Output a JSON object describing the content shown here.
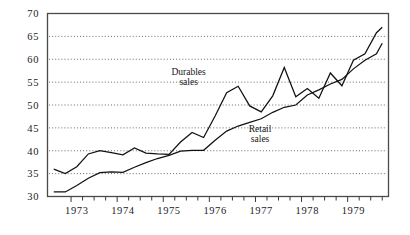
{
  "chart_data": {
    "type": "line",
    "title": "",
    "subtitle": "",
    "xlabel": "",
    "ylabel": "",
    "xlim": [
      1972.5,
      1979.875
    ],
    "ylim": [
      30,
      70
    ],
    "yticks": [
      30,
      35,
      40,
      45,
      50,
      55,
      60,
      65,
      70
    ],
    "ytick_labels": [
      "30",
      "35",
      "40",
      "45",
      "50",
      "55",
      "60",
      "65",
      "70"
    ],
    "xticks": [
      1973,
      1974,
      1975,
      1976,
      1977,
      1978,
      1979
    ],
    "xtick_labels": [
      "1973",
      "1974",
      "1975",
      "1976",
      "1977",
      "1978",
      "1979"
    ],
    "minor_xticks_per_year": 4,
    "grid": "horizontal-dotted",
    "legend": "inline-annotations",
    "x": [
      1972.625,
      1972.875,
      1973.125,
      1973.375,
      1973.625,
      1973.875,
      1974.125,
      1974.375,
      1974.625,
      1974.875,
      1975.125,
      1975.375,
      1975.625,
      1975.875,
      1976.125,
      1976.375,
      1976.625,
      1976.875,
      1977.125,
      1977.375,
      1977.625,
      1977.875,
      1978.125,
      1978.375,
      1978.625,
      1978.875,
      1979.125,
      1979.375,
      1979.625,
      1979.75
    ],
    "series": [
      {
        "name": "Durables sales",
        "label": "Durables\nsales",
        "label_line1": "Durables",
        "label_line2": "sales",
        "color": "#111111",
        "style": "solid",
        "values": [
          36.0,
          35.0,
          36.5,
          39.3,
          40.0,
          39.6,
          39.1,
          40.6,
          39.5,
          39.3,
          39.2,
          41.9,
          44.0,
          42.9,
          47.6,
          52.7,
          54.1,
          49.8,
          48.5,
          52.0,
          58.2,
          51.8,
          53.6,
          51.5,
          57.0,
          54.2,
          59.8,
          61.2,
          65.8,
          67.0
        ]
      },
      {
        "name": "Retail sales",
        "label": "Retail\nsales",
        "label_line1": "Retail",
        "label_line2": "sales",
        "color": "#111111",
        "style": "solid",
        "values": [
          31.0,
          31.0,
          32.4,
          34.0,
          35.2,
          35.4,
          35.3,
          36.4,
          37.4,
          38.3,
          39.0,
          39.9,
          40.1,
          40.1,
          42.3,
          44.3,
          45.4,
          46.2,
          47.0,
          48.4,
          49.5,
          50.0,
          52.2,
          53.3,
          54.6,
          55.6,
          57.9,
          59.8,
          61.2,
          63.5
        ]
      }
    ],
    "annotations": [
      {
        "name": "durables-sales-label",
        "text_line1": "Durables",
        "text_line2": "sales",
        "x": 1975.55,
        "y": 56.6
      },
      {
        "name": "retail-sales-label",
        "text_line1": "Retail",
        "text_line2": "sales",
        "x": 1977.1,
        "y": 44.0
      }
    ]
  }
}
